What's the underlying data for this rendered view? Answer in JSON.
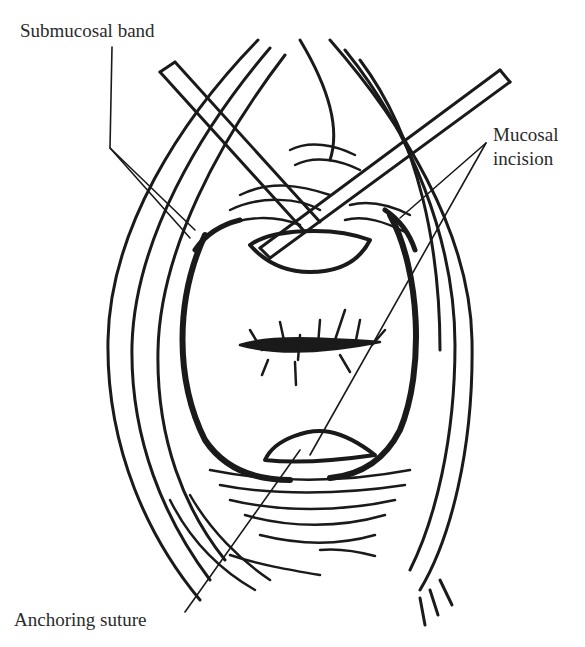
{
  "figure": {
    "type": "surgical line illustration",
    "colors": {
      "ink": "#1a1a1a",
      "background": "#ffffff",
      "label_text": "#2a2a2a"
    }
  },
  "labels": {
    "submucosal_band": "Submucosal band",
    "mucosal_incision_line1": "Mucosal",
    "mucosal_incision_line2": "incision",
    "anchoring_suture": "Anchoring suture"
  }
}
